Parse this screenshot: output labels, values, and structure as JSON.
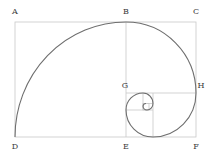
{
  "diagram": {
    "labels": [
      {
        "id": "A",
        "text": "A",
        "x": 15,
        "y": 12
      },
      {
        "id": "B",
        "text": "B",
        "x": 126,
        "y": 12
      },
      {
        "id": "C",
        "text": "C",
        "x": 196,
        "y": 12
      },
      {
        "id": "G",
        "text": "G",
        "x": 125,
        "y": 86
      },
      {
        "id": "H",
        "text": "H",
        "x": 201,
        "y": 86
      },
      {
        "id": "D",
        "text": "D",
        "x": 15,
        "y": 147
      },
      {
        "id": "E",
        "text": "E",
        "x": 126,
        "y": 147
      },
      {
        "id": "F",
        "text": "F",
        "x": 196,
        "y": 147
      }
    ],
    "colors": {
      "grid_line": "#c8c8c8",
      "spiral": "#6e6e6e",
      "label": "#3a3a3a"
    }
  }
}
